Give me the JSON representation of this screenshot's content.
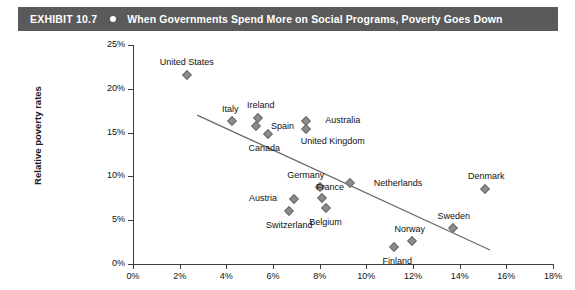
{
  "header": {
    "exhibit_label": "EXHIBIT 10.7",
    "bullet_icon": "dot-icon",
    "title": "When Governments Spend More on Social Programs, Poverty Goes Down",
    "bar_color": "#5a5a5a",
    "text_color": "#ffffff"
  },
  "chart_data": {
    "type": "scatter",
    "title": "When Governments Spend More on Social Programs, Poverty Goes Down",
    "xlabel": "",
    "ylabel": "Relative poverty rates",
    "xlim": [
      0,
      18
    ],
    "ylim": [
      0,
      25
    ],
    "xticks": [
      "0%",
      "2%",
      "4%",
      "6%",
      "8%",
      "10%",
      "12%",
      "14%",
      "16%",
      "18%"
    ],
    "yticks": [
      "0%",
      "5%",
      "10%",
      "15%",
      "20%",
      "25%"
    ],
    "xtick_values": [
      0,
      2,
      4,
      6,
      8,
      10,
      12,
      14,
      16,
      18
    ],
    "ytick_values": [
      0,
      5,
      10,
      15,
      20,
      25
    ],
    "grid": false,
    "legend": "none",
    "marker_color": "#8c8c8c",
    "marker_shape": "diamond",
    "trendline": {
      "x": [
        2.75,
        15.3
      ],
      "y": [
        17.0,
        1.6
      ],
      "color": "#6b6b6b"
    },
    "points": [
      {
        "label": "United States",
        "x": 2.3,
        "y": 21.6,
        "label_dx": 0,
        "label_dy": -13
      },
      {
        "label": "Italy",
        "x": 4.25,
        "y": 16.3,
        "label_dx": -2,
        "label_dy": -12
      },
      {
        "label": "Ireland",
        "x": 5.35,
        "y": 16.7,
        "label_dx": 3,
        "label_dy": -13
      },
      {
        "label": "Spain",
        "x": 5.25,
        "y": 15.8,
        "label_dx": 27,
        "label_dy": 0
      },
      {
        "label": "Canada",
        "x": 5.8,
        "y": 14.8,
        "label_dx": -4,
        "label_dy": 14
      },
      {
        "label": "Australia",
        "x": 7.4,
        "y": 16.3,
        "label_dx": 37,
        "label_dy": -1
      },
      {
        "label": "United Kingdom",
        "x": 7.4,
        "y": 15.4,
        "label_dx": 27,
        "label_dy": 12
      },
      {
        "label": "Germany",
        "x": 8.0,
        "y": 8.8,
        "label_dx": -14,
        "label_dy": -12
      },
      {
        "label": "Netherlands",
        "x": 9.3,
        "y": 9.3,
        "label_dx": 48,
        "label_dy": 0
      },
      {
        "label": "France",
        "x": 8.1,
        "y": 7.5,
        "label_dx": 8,
        "label_dy": -11
      },
      {
        "label": "Belgium",
        "x": 8.25,
        "y": 6.4,
        "label_dx": 0,
        "label_dy": 14
      },
      {
        "label": "Austria",
        "x": 6.9,
        "y": 7.4,
        "label_dx": -31,
        "label_dy": -1
      },
      {
        "label": "Switzerland",
        "x": 6.7,
        "y": 6.0,
        "label_dx": 0,
        "label_dy": 14
      },
      {
        "label": "Norway",
        "x": 11.95,
        "y": 2.6,
        "label_dx": -2,
        "label_dy": -12
      },
      {
        "label": "Finland",
        "x": 11.2,
        "y": 1.9,
        "label_dx": 3,
        "label_dy": 14
      },
      {
        "label": "Sweden",
        "x": 13.7,
        "y": 4.1,
        "label_dx": 1,
        "label_dy": -12
      },
      {
        "label": "Denmark",
        "x": 15.1,
        "y": 8.6,
        "label_dx": 1,
        "label_dy": -13
      }
    ]
  }
}
